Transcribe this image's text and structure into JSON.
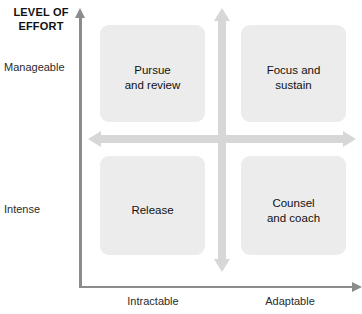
{
  "chart_data": {
    "type": "matrix",
    "title": "",
    "ylabel": "LEVEL OF\nEFFORT",
    "xlabel": "",
    "y_ticks": [
      "Manageable",
      "Intense"
    ],
    "x_ticks": [
      "Intractable",
      "Adaptable"
    ],
    "quadrants": [
      {
        "key": "top_left",
        "x": "Intractable",
        "y": "Manageable",
        "label": "Pursue\nand review"
      },
      {
        "key": "top_right",
        "x": "Adaptable",
        "y": "Manageable",
        "label": "Focus and\nsustain"
      },
      {
        "key": "bottom_left",
        "x": "Intractable",
        "y": "Intense",
        "label": "Release"
      },
      {
        "key": "bottom_right",
        "x": "Adaptable",
        "y": "Intense",
        "label": "Counsel\nand coach"
      }
    ],
    "colors": {
      "quadrant_fill": "#ececec",
      "axis": "#8c8c8c",
      "cross_arrow": "#d7d7d7",
      "text": "#111111"
    },
    "grid": false,
    "legend": null
  },
  "axes": {
    "y_title": "LEVEL OF\nEFFORT",
    "y_tick_top": "Manageable",
    "y_tick_bottom": "Intense",
    "x_tick_left": "Intractable",
    "x_tick_right": "Adaptable"
  },
  "quadrant_labels": {
    "top_left": "Pursue\nand review",
    "top_right": "Focus and\nsustain",
    "bottom_left": "Release",
    "bottom_right": "Counsel\nand coach"
  }
}
